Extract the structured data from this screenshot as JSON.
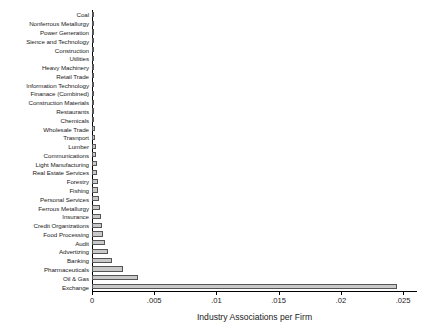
{
  "chart_data": {
    "type": "bar",
    "orientation": "horizontal",
    "title": "",
    "xlabel": "Industry Associations per Firm",
    "ylabel": "",
    "xlim": [
      0,
      0.0258
    ],
    "xticks": [
      0,
      0.005,
      0.01,
      0.015,
      0.02,
      0.025
    ],
    "xtick_labels": [
      "0",
      ".005",
      ".01",
      ".015",
      ".02",
      ".025"
    ],
    "grid": false,
    "legend": null,
    "bar_fill_color": "#c9c9c9",
    "bar_edge_color": "#555555",
    "axis_color": "#000000",
    "categories": [
      "Coal",
      "Nonferrous Metallurgy",
      "Power Generation",
      "Sience and Technology",
      "Construction",
      "Utilities",
      "Heavy Machinery",
      "Retail Trade",
      "Information Technology",
      "Finanace (Combined)",
      "Construction Materials",
      "Restaurants",
      "Chemicals",
      "Wholesale Trade",
      "Trasnport",
      "Lumber",
      "Communications",
      "Light Manufacturing",
      "Real Estate Services",
      "Forestry",
      "Fishing",
      "Personal Services",
      "Ferrous Metallurgy",
      "Insurance",
      "Credit Organizations",
      "Food Processing",
      "Audit",
      "Advertizing",
      "Banking",
      "Pharmaceuticals",
      "Oil & Gas",
      "Exchange"
    ],
    "values": [
      2e-05,
      3e-05,
      4e-05,
      5e-05,
      6e-05,
      7e-05,
      8e-05,
      9e-05,
      0.0001,
      0.00012,
      0.00014,
      0.00016,
      0.00018,
      0.00022,
      0.00026,
      0.0003,
      0.00034,
      0.00038,
      0.00042,
      0.00046,
      0.00052,
      0.00058,
      0.00064,
      0.0007,
      0.00078,
      0.00086,
      0.00102,
      0.00132,
      0.0016,
      0.0025,
      0.0037,
      0.0245
    ]
  }
}
